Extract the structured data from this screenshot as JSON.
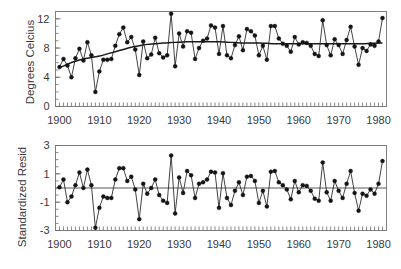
{
  "figure": {
    "title": "",
    "background_color": "#ffffff",
    "panels": 2
  },
  "chart_data": [
    {
      "type": "line",
      "panel": "top",
      "title": "",
      "xlabel": "",
      "ylabel": "Degrees Celcius",
      "xlim": [
        1899,
        1982
      ],
      "ylim": [
        0,
        13
      ],
      "yticks": [
        0,
        4,
        8,
        12
      ],
      "ytick_labels": [
        "0",
        "4",
        "8",
        "12"
      ],
      "xticks": [
        1900,
        1910,
        1920,
        1930,
        1940,
        1950,
        1960,
        1970,
        1980
      ],
      "xtick_labels": [
        "1900",
        "1910",
        "1920",
        "1930",
        "1940",
        "1950",
        "1960",
        "1970",
        "1980"
      ],
      "grid": false,
      "legend": false,
      "minor_ticks_x": true,
      "series": [
        {
          "name": "Annual mean temperature",
          "marker": "filled-circle",
          "color": "#141414",
          "x": [
            1900,
            1901,
            1902,
            1903,
            1904,
            1905,
            1906,
            1907,
            1908,
            1909,
            1910,
            1911,
            1912,
            1913,
            1914,
            1915,
            1916,
            1917,
            1918,
            1919,
            1920,
            1921,
            1922,
            1923,
            1924,
            1925,
            1926,
            1927,
            1928,
            1929,
            1930,
            1931,
            1932,
            1933,
            1934,
            1935,
            1936,
            1937,
            1938,
            1939,
            1940,
            1941,
            1942,
            1943,
            1944,
            1945,
            1946,
            1947,
            1948,
            1949,
            1950,
            1951,
            1952,
            1953,
            1954,
            1955,
            1956,
            1957,
            1958,
            1959,
            1960,
            1961,
            1962,
            1963,
            1964,
            1965,
            1966,
            1967,
            1968,
            1969,
            1970,
            1971,
            1972,
            1973,
            1974,
            1975,
            1976,
            1977,
            1978,
            1979,
            1980,
            1981
          ],
          "y": [
            5.4,
            6.5,
            5.6,
            4.0,
            6.6,
            7.9,
            6.3,
            8.8,
            7.0,
            2.0,
            4.8,
            6.4,
            6.4,
            6.5,
            8.3,
            9.9,
            10.8,
            8.8,
            9.5,
            7.8,
            4.3,
            8.9,
            6.6,
            7.1,
            9.4,
            7.3,
            6.7,
            7.0,
            12.7,
            5.5,
            10.0,
            8.2,
            10.3,
            10.1,
            6.5,
            8.0,
            9.0,
            9.3,
            11.1,
            10.8,
            7.2,
            11.0,
            7.0,
            6.6,
            8.4,
            9.6,
            7.7,
            10.6,
            10.3,
            9.7,
            7.0,
            8.3,
            6.4,
            11.0,
            11.0,
            9.3,
            8.6,
            8.3,
            7.5,
            9.5,
            8.5,
            8.8,
            8.7,
            8.3,
            7.2,
            6.9,
            11.8,
            8.4,
            7.0,
            9.2,
            8.4,
            7.2,
            9.1,
            10.9,
            8.2,
            5.7,
            8.0,
            7.6,
            8.5,
            8.3,
            8.9,
            12.1
          ]
        },
        {
          "name": "Smoothed trend",
          "marker": "none",
          "color": "#1a1a1a",
          "x": [
            1900,
            1902,
            1904,
            1906,
            1908,
            1910,
            1912,
            1914,
            1916,
            1918,
            1920,
            1922,
            1924,
            1926,
            1928,
            1930,
            1932,
            1934,
            1936,
            1938,
            1940,
            1942,
            1944,
            1946,
            1948,
            1950,
            1952,
            1954,
            1956,
            1958,
            1960,
            1962,
            1964,
            1966,
            1968,
            1970,
            1972,
            1974,
            1976,
            1978,
            1980,
            1981
          ],
          "y": [
            5.3,
            5.8,
            6.2,
            6.5,
            6.7,
            6.9,
            7.2,
            7.5,
            7.8,
            8.1,
            8.3,
            8.5,
            8.6,
            8.7,
            8.75,
            8.8,
            8.85,
            8.85,
            8.85,
            8.85,
            8.85,
            8.8,
            8.75,
            8.7,
            8.7,
            8.7,
            8.65,
            8.6,
            8.6,
            8.6,
            8.6,
            8.6,
            8.6,
            8.6,
            8.6,
            8.6,
            8.6,
            8.6,
            8.6,
            8.65,
            8.7,
            8.7
          ]
        }
      ]
    },
    {
      "type": "line",
      "panel": "bottom",
      "title": "",
      "xlabel": "",
      "ylabel": "Standardized Resid",
      "xlim": [
        1899,
        1982
      ],
      "ylim": [
        -3,
        3
      ],
      "yticks": [
        -3,
        -1,
        1,
        3
      ],
      "ytick_labels": [
        "-3",
        "-1",
        "1",
        "3"
      ],
      "xticks": [
        1900,
        1910,
        1920,
        1930,
        1940,
        1950,
        1960,
        1970,
        1980
      ],
      "xtick_labels": [
        "1900",
        "1910",
        "1920",
        "1930",
        "1940",
        "1950",
        "1960",
        "1970",
        "1980"
      ],
      "grid": false,
      "legend": false,
      "reference_line_y": 0,
      "minor_ticks_x": true,
      "series": [
        {
          "name": "Standardized residuals",
          "marker": "filled-circle",
          "color": "#141414",
          "x": [
            1900,
            1901,
            1902,
            1903,
            1904,
            1905,
            1906,
            1907,
            1908,
            1909,
            1910,
            1911,
            1912,
            1913,
            1914,
            1915,
            1916,
            1917,
            1918,
            1919,
            1920,
            1921,
            1922,
            1923,
            1924,
            1925,
            1926,
            1927,
            1928,
            1929,
            1930,
            1931,
            1932,
            1933,
            1934,
            1935,
            1936,
            1937,
            1938,
            1939,
            1940,
            1941,
            1942,
            1943,
            1944,
            1945,
            1946,
            1947,
            1948,
            1949,
            1950,
            1951,
            1952,
            1953,
            1954,
            1955,
            1956,
            1957,
            1958,
            1959,
            1960,
            1961,
            1962,
            1963,
            1964,
            1965,
            1966,
            1967,
            1968,
            1969,
            1970,
            1971,
            1972,
            1973,
            1974,
            1975,
            1976,
            1977,
            1978,
            1979,
            1980,
            1981
          ],
          "y": [
            0.05,
            0.6,
            -1.0,
            -0.6,
            0.2,
            1.1,
            0.0,
            1.3,
            0.2,
            -2.8,
            -1.4,
            -0.6,
            -0.7,
            -0.7,
            0.6,
            1.4,
            1.4,
            0.5,
            0.8,
            -0.1,
            -2.2,
            0.3,
            -0.4,
            0.0,
            0.6,
            -0.5,
            -0.9,
            -1.05,
            2.3,
            -1.8,
            0.75,
            -0.35,
            1.2,
            0.9,
            -0.7,
            0.3,
            0.4,
            0.6,
            1.15,
            1.1,
            -1.4,
            1.05,
            -0.7,
            -1.2,
            -0.2,
            0.4,
            -0.5,
            0.8,
            0.85,
            0.5,
            -1.05,
            -0.2,
            -1.3,
            1.15,
            1.2,
            0.4,
            0.2,
            -0.1,
            -0.8,
            0.5,
            -0.3,
            0.2,
            0.15,
            -0.2,
            -0.75,
            -0.9,
            1.8,
            -0.3,
            -0.9,
            0.5,
            -0.2,
            -0.7,
            0.3,
            1.2,
            -0.35,
            -1.6,
            -0.4,
            -0.55,
            -0.1,
            -0.4,
            0.3,
            1.9
          ]
        }
      ]
    }
  ]
}
